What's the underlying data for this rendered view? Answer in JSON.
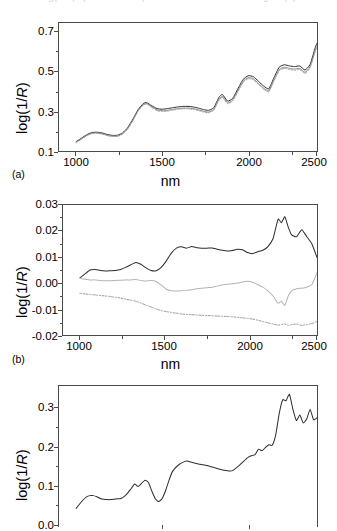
{
  "figure": {
    "clipped_caption": "log(1/R) spectra of samples measured in the NIR region (a)",
    "background": "#ffffff",
    "axis_color": "#4a4a4a"
  },
  "panels": [
    {
      "tag": "(a)",
      "ylabel": "log(1/R)",
      "xlabel": "nm",
      "yticks": [
        "0.1",
        "0.3",
        "0.5",
        "0.7"
      ],
      "xticks": [
        "1000",
        "1500",
        "2000",
        "2500"
      ]
    },
    {
      "tag": "(b)",
      "ylabel": "log(1/R)",
      "xlabel": "nm",
      "yticks": [
        "-0.02",
        "-0.01",
        "0.00",
        "0.01",
        "0.02",
        "0.03"
      ],
      "xticks": [
        "1000",
        "1500",
        "2000",
        "2500"
      ]
    },
    {
      "tag": "",
      "ylabel": "log(1/R)",
      "xlabel": "",
      "yticks": [
        "0.0",
        "0.1",
        "0.2",
        "0.3"
      ],
      "xticks": []
    }
  ],
  "chart_data": [
    {
      "type": "line",
      "panel": "(a)",
      "title": "",
      "xlabel": "nm",
      "ylabel": "log(1/R)",
      "xlim": [
        1000,
        2500
      ],
      "ylim": [
        0.1,
        0.78
      ],
      "xticks": [
        1000,
        1500,
        2000,
        2500
      ],
      "yticks": [
        0.1,
        0.3,
        0.5,
        0.7
      ],
      "grid": false,
      "legend": "none",
      "x": [
        1100,
        1130,
        1160,
        1190,
        1220,
        1250,
        1280,
        1310,
        1340,
        1370,
        1400,
        1430,
        1460,
        1490,
        1510,
        1540,
        1570,
        1600,
        1630,
        1660,
        1690,
        1720,
        1750,
        1780,
        1810,
        1840,
        1870,
        1900,
        1930,
        1950,
        1980,
        2010,
        2040,
        2070,
        2100,
        2130,
        2160,
        2190,
        2220,
        2250,
        2280,
        2310,
        2340,
        2370,
        2400,
        2430,
        2460,
        2490,
        2500
      ],
      "series": [
        {
          "name": "spectrum-1-solid-dark",
          "style": "solid",
          "color": "#2b2b2b",
          "values": [
            0.15,
            0.168,
            0.186,
            0.198,
            0.2,
            0.196,
            0.188,
            0.183,
            0.184,
            0.196,
            0.225,
            0.27,
            0.32,
            0.352,
            0.357,
            0.34,
            0.325,
            0.322,
            0.325,
            0.33,
            0.334,
            0.337,
            0.337,
            0.334,
            0.328,
            0.32,
            0.316,
            0.33,
            0.385,
            0.4,
            0.365,
            0.38,
            0.43,
            0.48,
            0.5,
            0.495,
            0.47,
            0.445,
            0.43,
            0.49,
            0.545,
            0.558,
            0.552,
            0.548,
            0.552,
            0.53,
            0.56,
            0.65,
            0.672
          ]
        },
        {
          "name": "spectrum-2-solid-gray",
          "style": "solid",
          "color": "#8a8a8a",
          "values": [
            0.147,
            0.164,
            0.182,
            0.194,
            0.196,
            0.192,
            0.184,
            0.179,
            0.18,
            0.192,
            0.22,
            0.265,
            0.315,
            0.347,
            0.352,
            0.334,
            0.318,
            0.314,
            0.316,
            0.321,
            0.325,
            0.328,
            0.328,
            0.325,
            0.319,
            0.311,
            0.307,
            0.321,
            0.375,
            0.39,
            0.356,
            0.371,
            0.42,
            0.47,
            0.49,
            0.484,
            0.459,
            0.434,
            0.42,
            0.478,
            0.532,
            0.545,
            0.539,
            0.535,
            0.539,
            0.518,
            0.548,
            0.636,
            0.658
          ]
        },
        {
          "name": "spectrum-3-dotted-gray",
          "style": "dotted",
          "color": "#9a9a9a",
          "values": [
            0.145,
            0.162,
            0.18,
            0.192,
            0.194,
            0.19,
            0.182,
            0.177,
            0.178,
            0.19,
            0.218,
            0.262,
            0.312,
            0.344,
            0.349,
            0.331,
            0.314,
            0.31,
            0.312,
            0.317,
            0.321,
            0.324,
            0.324,
            0.321,
            0.315,
            0.307,
            0.303,
            0.317,
            0.37,
            0.385,
            0.351,
            0.366,
            0.414,
            0.464,
            0.484,
            0.478,
            0.453,
            0.428,
            0.414,
            0.472,
            0.526,
            0.539,
            0.533,
            0.529,
            0.533,
            0.512,
            0.542,
            0.629,
            0.651
          ]
        }
      ]
    },
    {
      "type": "line",
      "panel": "(b)",
      "title": "",
      "xlabel": "nm",
      "ylabel": "log(1/R)",
      "xlim": [
        1000,
        2500
      ],
      "ylim": [
        -0.02,
        0.03
      ],
      "xticks": [
        1000,
        1500,
        2000,
        2500
      ],
      "yticks": [
        -0.02,
        -0.01,
        0.0,
        0.01,
        0.02,
        0.03
      ],
      "grid": false,
      "legend": "none",
      "x": [
        1100,
        1130,
        1160,
        1190,
        1220,
        1250,
        1280,
        1310,
        1340,
        1370,
        1400,
        1430,
        1460,
        1490,
        1520,
        1550,
        1580,
        1610,
        1640,
        1670,
        1700,
        1730,
        1760,
        1790,
        1820,
        1850,
        1880,
        1910,
        1940,
        1970,
        2000,
        2030,
        2060,
        2090,
        2120,
        2150,
        2180,
        2210,
        2240,
        2270,
        2290,
        2310,
        2330,
        2350,
        2380,
        2410,
        2440,
        2470,
        2500
      ],
      "series": [
        {
          "name": "loading-1-solid-dark",
          "style": "solid",
          "color": "#2b2b2b",
          "values": [
            0.002,
            0.0035,
            0.005,
            0.0052,
            0.0048,
            0.0046,
            0.0047,
            0.0048,
            0.0052,
            0.006,
            0.007,
            0.0079,
            0.0072,
            0.0058,
            0.0048,
            0.0047,
            0.006,
            0.0085,
            0.0115,
            0.0134,
            0.0139,
            0.0134,
            0.014,
            0.0136,
            0.0134,
            0.0134,
            0.0135,
            0.013,
            0.0126,
            0.0123,
            0.0125,
            0.013,
            0.0128,
            0.0117,
            0.0113,
            0.012,
            0.0126,
            0.014,
            0.017,
            0.0245,
            0.0232,
            0.0255,
            0.0215,
            0.0185,
            0.0178,
            0.0205,
            0.0178,
            0.015,
            0.0098
          ]
        },
        {
          "name": "loading-2-solid-lightgray",
          "style": "solid",
          "color": "#b4b4b4",
          "values": [
            0.0018,
            0.0014,
            0.0012,
            0.0012,
            0.001,
            0.0009,
            0.0009,
            0.001,
            0.0011,
            0.0012,
            0.0012,
            0.0013,
            0.001,
            0.0008,
            0.001,
            0.0006,
            -0.0008,
            -0.0024,
            -0.003,
            -0.0031,
            -0.003,
            -0.0028,
            -0.0026,
            -0.0022,
            -0.002,
            -0.0018,
            -0.0016,
            -0.0012,
            -0.0008,
            -0.0005,
            -0.0003,
            0.0,
            0.0004,
            0.0007,
            0.0003,
            -0.0006,
            -0.0016,
            -0.003,
            -0.005,
            -0.0078,
            -0.007,
            -0.0086,
            -0.005,
            -0.003,
            -0.0022,
            -0.002,
            -0.0016,
            -0.0006,
            0.004
          ]
        },
        {
          "name": "loading-3-dotted-gray",
          "style": "dotted",
          "color": "#8f8f8f",
          "values": [
            -0.004,
            -0.0042,
            -0.0044,
            -0.0046,
            -0.0048,
            -0.005,
            -0.0052,
            -0.0055,
            -0.0058,
            -0.0062,
            -0.0066,
            -0.007,
            -0.0077,
            -0.0085,
            -0.0092,
            -0.01,
            -0.0106,
            -0.011,
            -0.0113,
            -0.0116,
            -0.0119,
            -0.0121,
            -0.0122,
            -0.0123,
            -0.0124,
            -0.0125,
            -0.0126,
            -0.0127,
            -0.0128,
            -0.0129,
            -0.013,
            -0.0132,
            -0.0134,
            -0.0136,
            -0.0139,
            -0.0143,
            -0.0148,
            -0.0153,
            -0.0158,
            -0.0162,
            -0.016,
            -0.0158,
            -0.0163,
            -0.016,
            -0.0158,
            -0.0163,
            -0.016,
            -0.0156,
            -0.0148
          ]
        }
      ]
    },
    {
      "type": "line",
      "panel": "(c)",
      "title": "",
      "xlabel": "",
      "ylabel": "log(1/R)",
      "xlim": [
        1000,
        2500
      ],
      "ylim": [
        0.0,
        0.355
      ],
      "xticks": [
        1500,
        2000
      ],
      "yticks": [
        0.0,
        0.1,
        0.2,
        0.3
      ],
      "grid": false,
      "legend": "none",
      "x": [
        1100,
        1120,
        1140,
        1160,
        1180,
        1200,
        1220,
        1240,
        1260,
        1280,
        1300,
        1320,
        1340,
        1360,
        1380,
        1400,
        1420,
        1440,
        1460,
        1480,
        1500,
        1520,
        1540,
        1560,
        1580,
        1600,
        1620,
        1640,
        1660,
        1700,
        1740,
        1780,
        1820,
        1860,
        1900,
        1930,
        1960,
        1990,
        2010,
        2040,
        2060,
        2090,
        2110,
        2140,
        2160,
        2180,
        2200,
        2220,
        2240,
        2260,
        2280,
        2300,
        2320,
        2340,
        2360,
        2380,
        2400,
        2420,
        2440,
        2460,
        2480,
        2500
      ],
      "series": [
        {
          "name": "spectrum-solid-dark",
          "style": "solid",
          "color": "#2b2b2b",
          "values": [
            0.047,
            0.058,
            0.068,
            0.076,
            0.079,
            0.079,
            0.076,
            0.072,
            0.07,
            0.069,
            0.069,
            0.07,
            0.071,
            0.072,
            0.077,
            0.086,
            0.097,
            0.108,
            0.102,
            0.11,
            0.118,
            0.112,
            0.09,
            0.071,
            0.064,
            0.072,
            0.092,
            0.118,
            0.14,
            0.158,
            0.166,
            0.162,
            0.158,
            0.155,
            0.15,
            0.146,
            0.143,
            0.141,
            0.142,
            0.152,
            0.16,
            0.172,
            0.178,
            0.182,
            0.196,
            0.192,
            0.2,
            0.207,
            0.206,
            0.232,
            0.285,
            0.32,
            0.318,
            0.334,
            0.296,
            0.268,
            0.282,
            0.262,
            0.272,
            0.296,
            0.27,
            0.275
          ]
        }
      ]
    }
  ]
}
